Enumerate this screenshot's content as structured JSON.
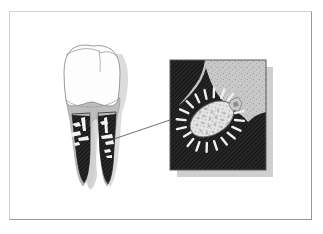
{
  "figure": {
    "domain_label": "scientific-illustration",
    "title": "Tooth with subgingival plaque and magnified bacterium",
    "background_color": "#ffffff",
    "frame": {
      "name": "figure-border",
      "x": 9,
      "y": 11,
      "width": 303,
      "height": 209,
      "light_edge_color": "#d2d2d2",
      "dark_edge_color": "#9a9a9a"
    },
    "palette": {
      "white": "#ffffff",
      "enamel_outline": "#8c8c8c",
      "enamel_fill": "#fdfdfd",
      "gum_gray": "#bdbdbd",
      "gum_gray_dark": "#a8a8a8",
      "root_dark": "#2b2b2b",
      "root_black": "#1c1c1c",
      "shadow_gray": "#cfcfcf",
      "inset_light": "#c9c9c9",
      "inset_dark": "#272727",
      "bacterium_fill": "#e3e3e3",
      "bacterium_outline": "#5a5a5a",
      "leader_line": "#4a4a4a",
      "stipple_dot": "#8a8a8a"
    }
  },
  "tooth": {
    "name": "molar-tooth",
    "label": "Molar tooth, cross-section view",
    "crown": {
      "name": "tooth-crown",
      "label": "Enamel crown",
      "fill": "#fdfdfd",
      "outline": "#8c8c8c"
    },
    "fissure": {
      "name": "occlusal-fissure",
      "label": "Occlusal fissure"
    },
    "neck_band": {
      "name": "gum-line-band",
      "label": "Cementoenamel junction / gum line",
      "fill": "#bdbdbd"
    },
    "roots": [
      {
        "name": "mesial-root",
        "label": "Mesial root with plaque deposit",
        "fill": "#262626"
      },
      {
        "name": "distal-root",
        "label": "Distal root with plaque deposit",
        "fill": "#262626"
      }
    ],
    "highlight_marks": {
      "name": "plaque-highlight-marks",
      "label": "Light calculus highlights on root surface",
      "fill": "#f2f2f2"
    },
    "drop_shadow": {
      "name": "tooth-shadow",
      "fill": "#d4d4d4"
    }
  },
  "leader_line": {
    "name": "magnification-leader-line",
    "label": "Leader line from root surface to magnified inset",
    "from_x": 108,
    "from_y": 140,
    "to_x": 170,
    "to_y": 120,
    "color": "#4a4a4a",
    "width": 0.8
  },
  "inset": {
    "name": "magnified-inset-panel",
    "label": "Magnified view of plaque biofilm at root surface",
    "x": 170,
    "y": 60,
    "width": 96,
    "height": 110,
    "border_color": "#5a5a5a",
    "shadow": {
      "name": "inset-drop-shadow",
      "offset_x": 7,
      "offset_y": 7,
      "fill": "#cfcfcf"
    },
    "background_light": {
      "name": "inset-tissue-region",
      "label": "Stippled gingival tissue",
      "fill": "#c9c9c9"
    },
    "background_dark": {
      "name": "inset-plaque-region",
      "label": "Dark plaque / calculus mass",
      "fill": "#272727"
    },
    "bacterium": {
      "name": "bacterium-cell",
      "label": "Rod-shaped bacterium with peritrichous fimbriae",
      "center_x": 212,
      "center_y": 119,
      "body_rx": 24,
      "body_ry": 15,
      "rotation_deg": -32,
      "fill": "#e3e3e3",
      "outline": "#555555",
      "spike_count": 26,
      "spike_length": 8,
      "granule_count": 46
    },
    "secondary_particle": {
      "name": "debris-particle",
      "label": "Small debris particle adjacent to bacterium",
      "center_x": 236,
      "center_y": 107
    }
  },
  "textures": {
    "stipple": {
      "name": "stipple-texture",
      "dot_color": "#8f8f8f",
      "dot_count": 210
    },
    "hatch": {
      "name": "diagonal-hatch-texture",
      "line_color": "#3a3a3a",
      "spacing": 2
    }
  }
}
